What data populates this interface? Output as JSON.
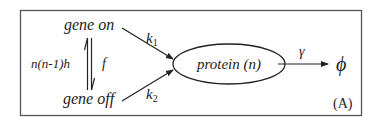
{
  "diagram": {
    "type": "reaction-scheme",
    "panel_label": "(A)",
    "nodes": {
      "gene_on": "gene on",
      "gene_off": "gene off",
      "protein": "protein (n)",
      "sink": "ϕ"
    },
    "rates": {
      "on_to_off_label": "n(n-1)h",
      "off_to_on_label": "f",
      "k1_base": "k",
      "k1_sub": "1",
      "k2_base": "k",
      "k2_sub": "2",
      "degradation": "γ"
    },
    "edges": [
      {
        "from": "gene on",
        "to": "gene off",
        "label": "n(n-1)h",
        "kind": "reversible-harpoon"
      },
      {
        "from": "gene off",
        "to": "gene on",
        "label": "f",
        "kind": "reversible-harpoon"
      },
      {
        "from": "gene on",
        "to": "protein (n)",
        "label": "k1"
      },
      {
        "from": "gene off",
        "to": "protein (n)",
        "label": "k2"
      },
      {
        "from": "protein (n)",
        "to": "ϕ",
        "label": "γ"
      }
    ],
    "colors": {
      "stroke": "#222222",
      "border": "#555555",
      "background": "#ffffff"
    }
  }
}
